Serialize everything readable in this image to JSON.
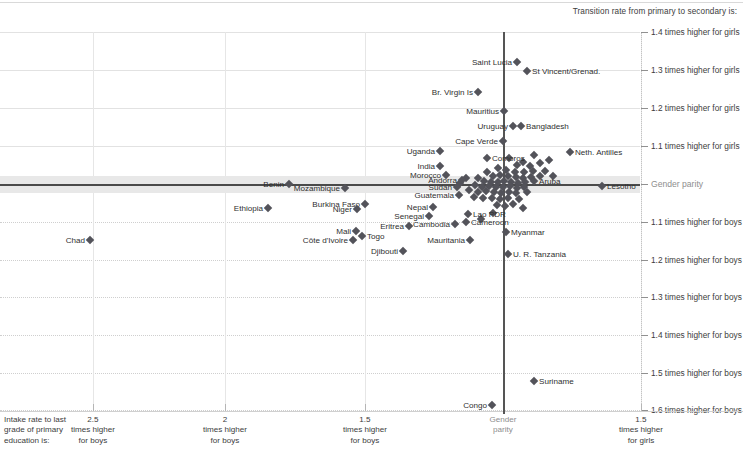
{
  "chart": {
    "title": "Transition rate from primary to secondary  is:",
    "xaxis_intro": "Intake rate to last\ngrade of primary\neducation is:",
    "parity_label_y": "Gender parity",
    "parity_label_x": "Gender\nparity"
  },
  "chart_data": {
    "type": "scatter",
    "title": "Transition rate from primary to secondary  is:",
    "xlabel": "Intake rate to last grade of primary education is:",
    "ylabel": "Transition rate from primary to secondary is:",
    "grid": true,
    "legend": "none",
    "xlim": [
      2.75,
      1.55
    ],
    "ylim": [
      1.45,
      1.65
    ],
    "x_ticks": [
      {
        "value": 2.5,
        "label": "2.5\ntimes higher\nfor boys",
        "px": 93
      },
      {
        "value": 2.0,
        "label": "2\ntimes higher\nfor boys",
        "px": 225
      },
      {
        "value": 1.5,
        "label": "1.5\ntimes higher\nfor boys",
        "px": 365
      },
      {
        "value": 1.0,
        "label": "Gender\nparity",
        "px": 503
      },
      {
        "value": 1.5,
        "label": "1.5\ntimes higher\nfor girls",
        "px": 641
      }
    ],
    "y_ticks": [
      {
        "value": 1.4,
        "label": "1.4 times higher for girls",
        "px": 32
      },
      {
        "value": 1.3,
        "label": "1.3 times higher for girls",
        "px": 70
      },
      {
        "value": 1.2,
        "label": "1.2 times higher for girls",
        "px": 108
      },
      {
        "value": 1.1,
        "label": "1.1 times higher for girls",
        "px": 146
      },
      {
        "value": 1.0,
        "label": "Gender parity",
        "px": 184
      },
      {
        "value": 1.1,
        "label": "1.1 times higher for boys",
        "px": 222
      },
      {
        "value": 1.2,
        "label": "1.2 times higher for boys",
        "px": 260
      },
      {
        "value": 1.3,
        "label": "1.3 times higher for boys",
        "px": 297
      },
      {
        "value": 1.4,
        "label": "1.4 times higher for boys",
        "px": 335
      },
      {
        "value": 1.5,
        "label": "1.5 times higher for boys",
        "px": 373
      },
      {
        "value": 1.6,
        "label": "1.6 times higher for boys",
        "px": 410
      }
    ],
    "labeled_points": [
      {
        "name": "Saint Lucia",
        "px": 517,
        "py": 62,
        "side": "left"
      },
      {
        "name": "St Vincent/Grenad.",
        "px": 527,
        "py": 71,
        "side": "right"
      },
      {
        "name": "Br. Virgin Is",
        "px": 478,
        "py": 92,
        "side": "left"
      },
      {
        "name": "Mauritius",
        "px": 504,
        "py": 111,
        "side": "left"
      },
      {
        "name": "Uruguay",
        "px": 513,
        "py": 126,
        "side": "left"
      },
      {
        "name": "Bangladesh",
        "px": 521,
        "py": 126,
        "side": "right"
      },
      {
        "name": "Cape Verde",
        "px": 503,
        "py": 141,
        "side": "left"
      },
      {
        "name": "Neth. Antilles",
        "px": 570,
        "py": 152,
        "side": "right"
      },
      {
        "name": "Uganda",
        "px": 440,
        "py": 151,
        "side": "left"
      },
      {
        "name": "Comoros",
        "px": 487,
        "py": 158,
        "side": "right"
      },
      {
        "name": "India",
        "px": 440,
        "py": 166,
        "side": "left"
      },
      {
        "name": "Morocco",
        "px": 446,
        "py": 175,
        "side": "left"
      },
      {
        "name": "Andorra",
        "px": 462,
        "py": 180,
        "side": "left"
      },
      {
        "name": "Sudan",
        "px": 457,
        "py": 187,
        "side": "left"
      },
      {
        "name": "Aruba",
        "px": 534,
        "py": 181,
        "side": "right"
      },
      {
        "name": "Lesotho",
        "px": 602,
        "py": 186,
        "side": "right"
      },
      {
        "name": "Benin",
        "px": 289,
        "py": 184,
        "side": "left"
      },
      {
        "name": "Mozambique",
        "px": 345,
        "py": 188,
        "side": "left"
      },
      {
        "name": "Guatemala",
        "px": 459,
        "py": 195,
        "side": "left"
      },
      {
        "name": "Ethiopia",
        "px": 268,
        "py": 208,
        "side": "left"
      },
      {
        "name": "Burkina Faso",
        "px": 365,
        "py": 204,
        "side": "left"
      },
      {
        "name": "Niger",
        "px": 357,
        "py": 209,
        "side": "left"
      },
      {
        "name": "Nepal",
        "px": 433,
        "py": 207,
        "side": "left"
      },
      {
        "name": "Lao PDR",
        "px": 468,
        "py": 214,
        "side": "right"
      },
      {
        "name": "Senegal",
        "px": 429,
        "py": 216,
        "side": "left"
      },
      {
        "name": "Cameroon",
        "px": 466,
        "py": 222,
        "side": "right"
      },
      {
        "name": "Eritrea",
        "px": 409,
        "py": 226,
        "side": "left"
      },
      {
        "name": "Cambodia",
        "px": 455,
        "py": 224,
        "side": "left"
      },
      {
        "name": "Mali",
        "px": 356,
        "py": 231,
        "side": "left"
      },
      {
        "name": "Togo",
        "px": 362,
        "py": 236,
        "side": "right"
      },
      {
        "name": "Myanmar",
        "px": 506,
        "py": 232,
        "side": "right"
      },
      {
        "name": "Côte d'Ivoire",
        "px": 353,
        "py": 240,
        "side": "left"
      },
      {
        "name": "Mauritania",
        "px": 470,
        "py": 240,
        "side": "left"
      },
      {
        "name": "Djibouti",
        "px": 403,
        "py": 251,
        "side": "left"
      },
      {
        "name": "U. R. Tanzania",
        "px": 508,
        "py": 254,
        "side": "right"
      },
      {
        "name": "Chad",
        "px": 90,
        "py": 240,
        "side": "left"
      },
      {
        "name": "Suriname",
        "px": 534,
        "py": 381,
        "side": "right"
      },
      {
        "name": "Congo",
        "px": 492,
        "py": 405,
        "side": "left"
      }
    ],
    "unlabeled_points": [
      {
        "px": 534,
        "py": 155
      },
      {
        "px": 549,
        "py": 160
      },
      {
        "px": 523,
        "py": 162
      },
      {
        "px": 509,
        "py": 158
      },
      {
        "px": 517,
        "py": 165
      },
      {
        "px": 530,
        "py": 166
      },
      {
        "px": 540,
        "py": 163
      },
      {
        "px": 498,
        "py": 168
      },
      {
        "px": 506,
        "py": 170
      },
      {
        "px": 515,
        "py": 172
      },
      {
        "px": 524,
        "py": 172
      },
      {
        "px": 533,
        "py": 171
      },
      {
        "px": 487,
        "py": 172
      },
      {
        "px": 493,
        "py": 176
      },
      {
        "px": 500,
        "py": 175
      },
      {
        "px": 508,
        "py": 176
      },
      {
        "px": 516,
        "py": 177
      },
      {
        "px": 523,
        "py": 178
      },
      {
        "px": 531,
        "py": 177
      },
      {
        "px": 540,
        "py": 176
      },
      {
        "px": 478,
        "py": 178
      },
      {
        "px": 484,
        "py": 181
      },
      {
        "px": 491,
        "py": 182
      },
      {
        "px": 498,
        "py": 182
      },
      {
        "px": 504,
        "py": 181
      },
      {
        "px": 511,
        "py": 182
      },
      {
        "px": 518,
        "py": 183
      },
      {
        "px": 525,
        "py": 182
      },
      {
        "px": 475,
        "py": 185
      },
      {
        "px": 482,
        "py": 187
      },
      {
        "px": 489,
        "py": 186
      },
      {
        "px": 496,
        "py": 187
      },
      {
        "px": 503,
        "py": 187
      },
      {
        "px": 510,
        "py": 186
      },
      {
        "px": 517,
        "py": 188
      },
      {
        "px": 524,
        "py": 187
      },
      {
        "px": 469,
        "py": 190
      },
      {
        "px": 478,
        "py": 192
      },
      {
        "px": 486,
        "py": 191
      },
      {
        "px": 494,
        "py": 192
      },
      {
        "px": 501,
        "py": 193
      },
      {
        "px": 509,
        "py": 192
      },
      {
        "px": 516,
        "py": 193
      },
      {
        "px": 527,
        "py": 192
      },
      {
        "px": 474,
        "py": 197
      },
      {
        "px": 483,
        "py": 198
      },
      {
        "px": 492,
        "py": 198
      },
      {
        "px": 500,
        "py": 199
      },
      {
        "px": 508,
        "py": 198
      },
      {
        "px": 519,
        "py": 199
      },
      {
        "px": 497,
        "py": 205
      },
      {
        "px": 505,
        "py": 206
      },
      {
        "px": 513,
        "py": 204
      },
      {
        "px": 523,
        "py": 208
      },
      {
        "px": 493,
        "py": 213
      },
      {
        "px": 481,
        "py": 219
      },
      {
        "px": 545,
        "py": 171
      },
      {
        "px": 553,
        "py": 176
      },
      {
        "px": 460,
        "py": 183
      },
      {
        "px": 466,
        "py": 178
      }
    ]
  }
}
